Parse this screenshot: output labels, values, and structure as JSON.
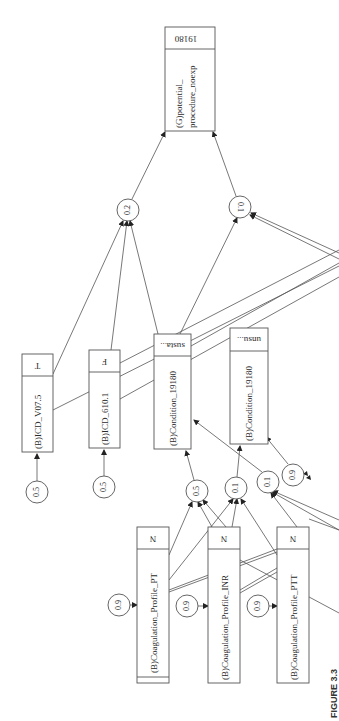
{
  "figure": {
    "caption": "FIGURE 3.3"
  },
  "nodes": {
    "goal": {
      "label_line1": "(G)potential_",
      "label_line2": "procedure_noexp",
      "state": "19180"
    },
    "icd_v075": {
      "label": "(B)ICD_V07.5",
      "state": "T"
    },
    "icd_6101": {
      "label": "(B)ICD_610.1",
      "state": "F"
    },
    "cond_susta": {
      "label": "(B)Condition_19180",
      "state": "susta..."
    },
    "cond_unsu": {
      "label": "(B)Condition_19180",
      "state": "unsu..."
    },
    "coag_pt": {
      "label": "(B)Coagulation_Profile_PT",
      "state": "N"
    },
    "coag_inr": {
      "label": "(B)Coagulation_Profile_INR",
      "state": "N"
    },
    "coag_ptt": {
      "label": "(B)Coagulation_Profile_PTT",
      "state": "N"
    }
  },
  "probabilities": {
    "p_goal_left": "0.2",
    "p_goal_right": "0.1",
    "p_icd_v075": "0.5",
    "p_icd_6101": "0.5",
    "p_cond_susta": "0.5",
    "p_cond_unsu": "0.1",
    "p_cond_susta_2": "0.1",
    "p_right": "0.9",
    "p_coag_pt": "0.9",
    "p_coag_inr": "0.9",
    "p_coag_ptt": "0.9"
  },
  "colors": {
    "stroke": "#555555",
    "text": "#2a2a2a",
    "background": "#ffffff"
  }
}
